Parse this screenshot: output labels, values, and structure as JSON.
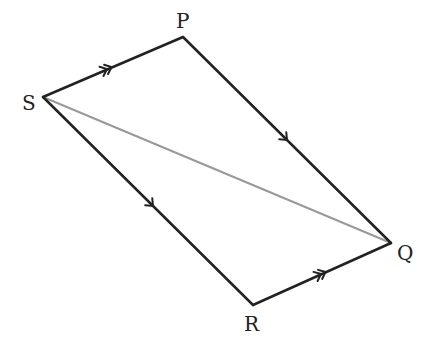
{
  "diagram": {
    "type": "parallelogram",
    "vertices": {
      "P": {
        "label": "P",
        "x": 183,
        "y": 37
      },
      "Q": {
        "label": "Q",
        "x": 391,
        "y": 243
      },
      "R": {
        "label": "R",
        "x": 253,
        "y": 305
      },
      "S": {
        "label": "S",
        "x": 43,
        "y": 97
      }
    },
    "edges": [
      {
        "from": "S",
        "to": "P",
        "marker": "double-arrow",
        "color": "#222222"
      },
      {
        "from": "P",
        "to": "Q",
        "marker": "single-arrow",
        "color": "#222222"
      },
      {
        "from": "S",
        "to": "R",
        "marker": "single-arrow",
        "color": "#222222"
      },
      {
        "from": "R",
        "to": "Q",
        "marker": "double-arrow",
        "color": "#222222"
      }
    ],
    "diagonal": {
      "from": "S",
      "to": "Q",
      "color": "#999999"
    }
  }
}
